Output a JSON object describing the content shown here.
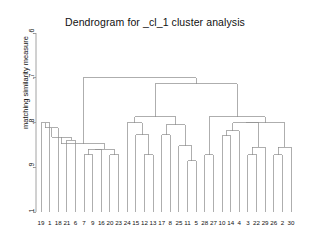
{
  "chart_data": {
    "type": "dendrogram",
    "title": "Dendrogram for _cl_1 cluster analysis",
    "xlabel": "",
    "ylabel": "matching similarity measure",
    "ylim": [
      0.6,
      1.0
    ],
    "y_axis_inverted": true,
    "grid": false,
    "legend": null,
    "y_ticks": [
      {
        "value": 0.6,
        "label": ".6"
      },
      {
        "value": 0.7,
        "label": ".7"
      },
      {
        "value": 0.8,
        "label": ".8"
      },
      {
        "value": 0.9,
        "label": ".9"
      },
      {
        "value": 1.0,
        "label": "1"
      }
    ],
    "leaf_labels": [
      "19",
      "1",
      "18",
      "21",
      "6",
      "7",
      "9",
      "16",
      "20",
      "23",
      "24",
      "15",
      "12",
      "13",
      "17",
      "8",
      "25",
      "11",
      "5",
      "28",
      "27",
      "10",
      "14",
      "4",
      "3",
      "22",
      "29",
      "26",
      "2",
      "30"
    ],
    "leaf_count": 30,
    "leaf_base_value": 1.0,
    "merges": [
      {
        "id": "m1",
        "left": {
          "leaf": "19"
        },
        "right": {
          "leaf": "1"
        },
        "height": 0.8
      },
      {
        "id": "m2",
        "left": {
          "node": "m1"
        },
        "right": {
          "leaf": "18"
        },
        "height": 0.812
      },
      {
        "id": "m3",
        "left": {
          "leaf": "21"
        },
        "right": {
          "leaf": "6"
        },
        "height": 0.84
      },
      {
        "id": "m4",
        "left": {
          "node": "m2"
        },
        "right": {
          "node": "m3"
        },
        "height": 0.833
      },
      {
        "id": "m5",
        "left": {
          "leaf": "7"
        },
        "right": {
          "leaf": "9"
        },
        "height": 0.872
      },
      {
        "id": "m6",
        "left": {
          "node": "m5"
        },
        "right": {
          "leaf": "16"
        },
        "height": 0.86
      },
      {
        "id": "m7",
        "left": {
          "leaf": "20"
        },
        "right": {
          "leaf": "23"
        },
        "height": 0.872
      },
      {
        "id": "m8",
        "left": {
          "node": "m6"
        },
        "right": {
          "node": "m7"
        },
        "height": 0.86
      },
      {
        "id": "m9",
        "left": {
          "node": "m4"
        },
        "right": {
          "node": "m8"
        },
        "height": 0.847
      },
      {
        "id": "m10",
        "left": {
          "leaf": "12"
        },
        "right": {
          "leaf": "13"
        },
        "height": 0.872
      },
      {
        "id": "m11",
        "left": {
          "leaf": "15"
        },
        "right": {
          "node": "m10"
        },
        "height": 0.827
      },
      {
        "id": "m12",
        "left": {
          "leaf": "24"
        },
        "right": {
          "node": "m11"
        },
        "height": 0.8
      },
      {
        "id": "m13",
        "left": {
          "leaf": "17"
        },
        "right": {
          "leaf": "8"
        },
        "height": 0.827
      },
      {
        "id": "m14",
        "left": {
          "leaf": "11"
        },
        "right": {
          "leaf": "5"
        },
        "height": 0.885
      },
      {
        "id": "m15",
        "left": {
          "leaf": "25"
        },
        "right": {
          "node": "m14"
        },
        "height": 0.852
      },
      {
        "id": "m16",
        "left": {
          "node": "m13"
        },
        "right": {
          "node": "m15"
        },
        "height": 0.805
      },
      {
        "id": "m17",
        "left": {
          "node": "m12"
        },
        "right": {
          "node": "m16"
        },
        "height": 0.787
      },
      {
        "id": "m18",
        "left": {
          "leaf": "28"
        },
        "right": {
          "leaf": "27"
        },
        "height": 0.872
      },
      {
        "id": "m19",
        "left": {
          "leaf": "10"
        },
        "right": {
          "leaf": "14"
        },
        "height": 0.83
      },
      {
        "id": "m20",
        "left": {
          "node": "m19"
        },
        "right": {
          "leaf": "4"
        },
        "height": 0.818
      },
      {
        "id": "m21",
        "left": {
          "leaf": "3"
        },
        "right": {
          "leaf": "22"
        },
        "height": 0.872
      },
      {
        "id": "m22",
        "left": {
          "node": "m21"
        },
        "right": {
          "leaf": "29"
        },
        "height": 0.855
      },
      {
        "id": "m23",
        "left": {
          "node": "m20"
        },
        "right": {
          "node": "m22"
        },
        "height": 0.8
      },
      {
        "id": "m24",
        "left": {
          "leaf": "26"
        },
        "right": {
          "leaf": "2"
        },
        "height": 0.872
      },
      {
        "id": "m25",
        "left": {
          "node": "m24"
        },
        "right": {
          "leaf": "30"
        },
        "height": 0.855
      },
      {
        "id": "m26",
        "left": {
          "node": "m23"
        },
        "right": {
          "node": "m25"
        },
        "height": 0.8
      },
      {
        "id": "m27",
        "left": {
          "node": "m18"
        },
        "right": {
          "node": "m26"
        },
        "height": 0.787
      },
      {
        "id": "m28",
        "left": {
          "node": "m17"
        },
        "right": {
          "node": "m27"
        },
        "height": 0.713
      },
      {
        "id": "m29",
        "left": {
          "node": "m9"
        },
        "right": {
          "node": "m28"
        },
        "height": 0.7
      }
    ],
    "line_color": "#8c8c8c",
    "axis_color": "#8c8c8c"
  }
}
